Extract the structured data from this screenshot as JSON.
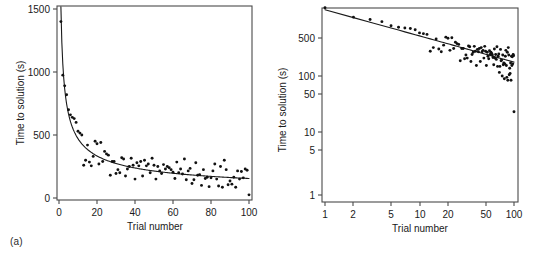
{
  "figure": {
    "panels": [
      {
        "tag": "(a)",
        "xlabel": "Trial number",
        "ylabel": "Time to solution (s)"
      },
      {
        "tag": "(b)",
        "xlabel": "Trial number",
        "ylabel": "Time to solution (s)"
      }
    ]
  },
  "chart_data": [
    {
      "type": "scatter",
      "title": "",
      "panel": "(a)",
      "xlabel": "Trial number",
      "ylabel": "Time to solution (s)",
      "xscale": "linear",
      "yscale": "linear",
      "xlim": [
        0,
        103
      ],
      "ylim": [
        0,
        1560
      ],
      "xticks": [
        0,
        20,
        40,
        60,
        80,
        100
      ],
      "yticks": [
        0,
        500,
        1000,
        1500
      ],
      "grid": false,
      "legend": null,
      "series": [
        {
          "name": "Time to solution",
          "marker": "dot",
          "color": "#111111",
          "x": [
            1,
            2,
            3,
            4,
            5,
            6,
            7,
            8,
            9,
            10,
            11,
            12,
            13,
            14,
            15,
            16,
            17,
            18,
            19,
            20,
            21,
            22,
            23,
            24,
            25,
            26,
            27,
            28,
            29,
            30,
            31,
            32,
            33,
            34,
            35,
            36,
            37,
            38,
            39,
            40,
            41,
            42,
            43,
            44,
            45,
            46,
            47,
            48,
            49,
            50,
            51,
            52,
            53,
            54,
            55,
            56,
            57,
            58,
            59,
            60,
            61,
            62,
            63,
            64,
            65,
            66,
            67,
            68,
            69,
            70,
            71,
            72,
            73,
            74,
            75,
            76,
            77,
            78,
            79,
            80,
            81,
            82,
            83,
            84,
            85,
            86,
            87,
            88,
            89,
            90,
            91,
            92,
            93,
            94,
            95,
            96,
            97,
            98,
            99,
            100
          ],
          "y": [
            1400,
            975,
            890,
            820,
            700,
            660,
            640,
            630,
            600,
            530,
            515,
            500,
            260,
            300,
            420,
            285,
            255,
            330,
            450,
            430,
            270,
            440,
            290,
            370,
            350,
            340,
            180,
            290,
            290,
            195,
            225,
            200,
            320,
            310,
            175,
            230,
            250,
            315,
            260,
            150,
            280,
            255,
            290,
            175,
            300,
            255,
            270,
            200,
            315,
            260,
            150,
            250,
            215,
            195,
            265,
            230,
            250,
            240,
            225,
            205,
            155,
            285,
            200,
            230,
            190,
            310,
            145,
            215,
            235,
            115,
            145,
            280,
            180,
            185,
            100,
            225,
            155,
            165,
            90,
            160,
            215,
            270,
            150,
            95,
            250,
            85,
            300,
            225,
            105,
            135,
            110,
            165,
            85,
            215,
            150,
            210,
            160,
            230,
            220,
            25
          ]
        },
        {
          "name": "Power-law fit",
          "type": "line",
          "color": "#1a1a1a",
          "description": "T = a * N^-b fitted decay curve, from ~1500 s at trial 1 to ~150 s at trial 100"
        }
      ]
    },
    {
      "type": "scatter",
      "title": "",
      "panel": "(b)",
      "xlabel": "Trial number",
      "ylabel": "Time to solution (s)",
      "xscale": "log",
      "yscale": "log",
      "xlim": [
        1,
        110
      ],
      "ylim": [
        1,
        1600
      ],
      "xticks": [
        1,
        2,
        5,
        10,
        20,
        50,
        100
      ],
      "yticks": [
        1,
        5,
        10,
        50,
        100,
        500
      ],
      "grid": false,
      "legend": null,
      "note": "Same data as panel (a) plotted on log-log axes; the power law of practice appears as a straight line",
      "series": [
        {
          "name": "Time to solution",
          "marker": "dot",
          "color": "#111111",
          "x": [
            1,
            2,
            3,
            4,
            5,
            6,
            7,
            8,
            9,
            10,
            11,
            12,
            13,
            14,
            15,
            16,
            17,
            18,
            19,
            20,
            21,
            22,
            23,
            24,
            25,
            26,
            27,
            28,
            29,
            30,
            31,
            32,
            33,
            34,
            35,
            36,
            37,
            38,
            39,
            40,
            41,
            42,
            43,
            44,
            45,
            46,
            47,
            48,
            49,
            50,
            51,
            52,
            53,
            54,
            55,
            56,
            57,
            58,
            59,
            60,
            61,
            62,
            63,
            64,
            65,
            66,
            67,
            68,
            69,
            70,
            71,
            72,
            73,
            74,
            75,
            76,
            77,
            78,
            79,
            80,
            81,
            82,
            83,
            84,
            85,
            86,
            87,
            88,
            89,
            90,
            91,
            92,
            93,
            94,
            95,
            96,
            97,
            98,
            99,
            100
          ],
          "y": [
            1400,
            975,
            890,
            820,
            700,
            660,
            640,
            630,
            600,
            530,
            515,
            500,
            260,
            300,
            420,
            285,
            255,
            330,
            450,
            430,
            270,
            440,
            290,
            370,
            350,
            340,
            180,
            290,
            290,
            195,
            225,
            200,
            320,
            310,
            175,
            230,
            250,
            315,
            260,
            150,
            280,
            255,
            290,
            175,
            300,
            255,
            270,
            200,
            315,
            260,
            150,
            250,
            215,
            195,
            265,
            230,
            250,
            240,
            225,
            205,
            155,
            285,
            200,
            230,
            190,
            310,
            145,
            215,
            235,
            115,
            145,
            280,
            180,
            185,
            100,
            225,
            155,
            165,
            90,
            160,
            215,
            270,
            150,
            95,
            250,
            85,
            300,
            225,
            105,
            135,
            110,
            165,
            85,
            215,
            150,
            210,
            160,
            230,
            220,
            25
          ]
        },
        {
          "name": "Power-law fit",
          "type": "line",
          "color": "#1a1a1a",
          "description": "Straight line on log-log axes from ~1300 s at trial 1 to ~170 s at trial 100"
        }
      ]
    }
  ]
}
